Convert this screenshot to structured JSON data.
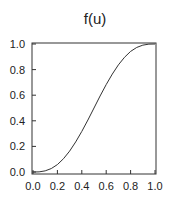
{
  "chart_data": {
    "type": "line",
    "title": "f(u)",
    "xlabel": "",
    "ylabel": "",
    "xlim": [
      0.0,
      1.0
    ],
    "ylim": [
      0.0,
      1.0
    ],
    "grid": false,
    "legend": null,
    "x_ticks": [
      "0.0",
      "0.2",
      "0.4",
      "0.6",
      "0.8",
      "1.0"
    ],
    "y_ticks": [
      "0.0",
      "0.2",
      "0.4",
      "0.6",
      "0.8",
      "1.0"
    ],
    "series": [
      {
        "name": "f(u)",
        "x": [
          0.0,
          0.05,
          0.1,
          0.15,
          0.2,
          0.25,
          0.3,
          0.35,
          0.4,
          0.45,
          0.5,
          0.55,
          0.6,
          0.65,
          0.7,
          0.75,
          0.8,
          0.85,
          0.9,
          0.95,
          1.0
        ],
        "values": [
          0.0,
          0.001,
          0.009,
          0.027,
          0.058,
          0.104,
          0.163,
          0.235,
          0.317,
          0.406,
          0.5,
          0.594,
          0.683,
          0.765,
          0.837,
          0.896,
          0.942,
          0.973,
          0.991,
          0.999,
          1.0
        ]
      }
    ],
    "colors": {
      "line": "#333333",
      "axes": "#333333",
      "background": "#ffffff"
    }
  }
}
